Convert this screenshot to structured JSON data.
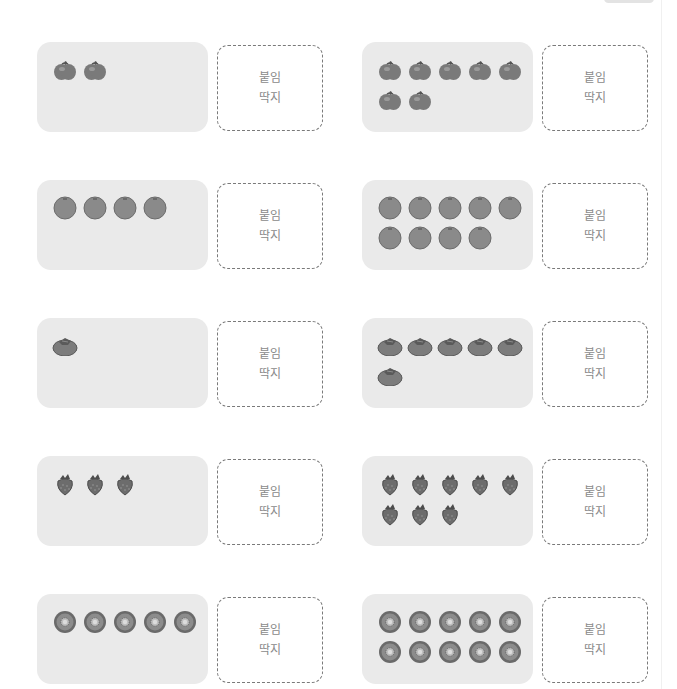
{
  "colors": {
    "card_bg": "#eaeaea",
    "sticker_border": "#7a7a7a",
    "sticker_text": "#8a8a8a",
    "fruit_fill": "#7c7c7c",
    "fruit_dark": "#555555"
  },
  "sticker_label": {
    "line1": "붙임",
    "line2": "딱지"
  },
  "rows": [
    {
      "fruit": "apple",
      "left": {
        "count": 2
      },
      "right": {
        "count": 7
      }
    },
    {
      "fruit": "orange",
      "left": {
        "count": 4
      },
      "right": {
        "count": 9
      }
    },
    {
      "fruit": "persimmon",
      "left": {
        "count": 1
      },
      "right": {
        "count": 6
      }
    },
    {
      "fruit": "strawberry",
      "left": {
        "count": 3
      },
      "right": {
        "count": 8
      }
    },
    {
      "fruit": "kiwi",
      "left": {
        "count": 5
      },
      "right": {
        "count": 10
      }
    }
  ]
}
